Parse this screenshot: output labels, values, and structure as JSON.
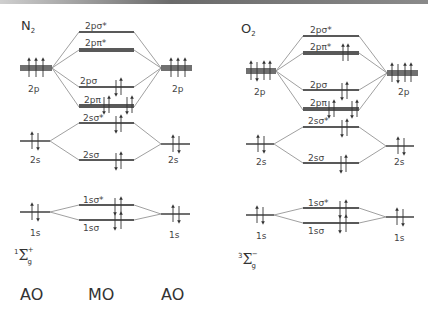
{
  "diagrams": [
    {
      "molecule": "N",
      "molecule_sub": "2",
      "term_symbol": {
        "multiplicity": "1",
        "symbol": "Σ",
        "sub": "g",
        "sup": "+"
      },
      "ao_left": {
        "2p": "2p",
        "2s": "2s",
        "1s": "1s"
      },
      "ao_right": {
        "2p": "2p",
        "2s": "2s",
        "1s": "1s"
      },
      "mos": [
        {
          "label": "2pσ*",
          "electrons": 0
        },
        {
          "label": "2pπ*",
          "electrons": 0
        },
        {
          "label": "2pσ",
          "electrons": 2
        },
        {
          "label": "2pπ",
          "electrons": 4
        },
        {
          "label": "2sσ*",
          "electrons": 2
        },
        {
          "label": "2sσ",
          "electrons": 2
        },
        {
          "label": "1sσ*",
          "electrons": 2
        },
        {
          "label": "1sσ",
          "electrons": 2
        }
      ]
    },
    {
      "molecule": "O",
      "molecule_sub": "2",
      "term_symbol": {
        "multiplicity": "3",
        "symbol": "Σ",
        "sub": "g",
        "sup": "−"
      },
      "ao_left": {
        "2p": "2p",
        "2s": "2s",
        "1s": "1s"
      },
      "ao_right": {
        "2p": "2p",
        "2s": "2s",
        "1s": "1s"
      },
      "mos": [
        {
          "label": "2pσ*",
          "electrons": 0
        },
        {
          "label": "2pπ*",
          "electrons": 2
        },
        {
          "label": "2pσ",
          "electrons": 2
        },
        {
          "label": "2pπ",
          "electrons": 4
        },
        {
          "label": "2sσ*",
          "electrons": 2
        },
        {
          "label": "2sσ",
          "electrons": 2
        },
        {
          "label": "1sσ*",
          "electrons": 2
        },
        {
          "label": "1sσ",
          "electrons": 2
        }
      ]
    }
  ],
  "axis_labels": {
    "left": "AO",
    "middle": "MO",
    "right": "AO"
  }
}
